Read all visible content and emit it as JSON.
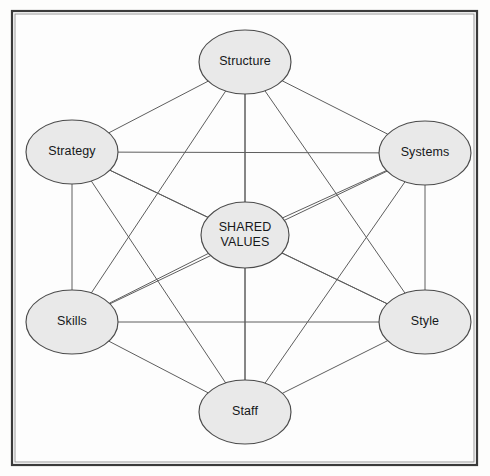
{
  "diagram": {
    "name": "McKinsey 7S Framework",
    "type": "network-diagram",
    "graph": "complete-graph-k7",
    "frame": {
      "x": 12,
      "y": 11,
      "width": 465,
      "height": 454,
      "border_color": "#3a3a3a",
      "background_color": "#fdfdfd"
    },
    "style": {
      "node_fill": "#e9e9e9",
      "node_stroke": "#4b4b4b",
      "edge_color": "#5e5e5e",
      "label_color": "#16181a",
      "page_background": "#fdfdfc"
    },
    "node_geometry": {
      "rx": 46,
      "ry": 32
    },
    "nodes": [
      {
        "id": "structure",
        "label": "Structure",
        "lines": [
          "Structure"
        ],
        "cx": 245,
        "cy": 62,
        "rx": 46,
        "ry": 32
      },
      {
        "id": "systems",
        "label": "Systems",
        "lines": [
          "Systems"
        ],
        "cx": 425,
        "cy": 153,
        "rx": 46,
        "ry": 32
      },
      {
        "id": "style",
        "label": "Style",
        "lines": [
          "Style"
        ],
        "cx": 425,
        "cy": 322,
        "rx": 46,
        "ry": 32
      },
      {
        "id": "staff",
        "label": "Staff",
        "lines": [
          "Staff"
        ],
        "cx": 245,
        "cy": 412,
        "rx": 46,
        "ry": 32
      },
      {
        "id": "skills",
        "label": "Skills",
        "lines": [
          "Skills"
        ],
        "cx": 72,
        "cy": 322,
        "rx": 46,
        "ry": 32
      },
      {
        "id": "strategy",
        "label": "Strategy",
        "lines": [
          "Strategy"
        ],
        "cx": 72,
        "cy": 152,
        "rx": 46,
        "ry": 32
      },
      {
        "id": "shared_values",
        "label": "SHARED VALUES",
        "lines": [
          "SHARED",
          "VALUES"
        ],
        "cx": 245,
        "cy": 235,
        "rx": 44,
        "ry": 33
      }
    ],
    "edges": [
      {
        "from": "structure",
        "to": "systems"
      },
      {
        "from": "structure",
        "to": "style"
      },
      {
        "from": "structure",
        "to": "staff"
      },
      {
        "from": "structure",
        "to": "skills"
      },
      {
        "from": "structure",
        "to": "strategy"
      },
      {
        "from": "structure",
        "to": "shared_values"
      },
      {
        "from": "systems",
        "to": "style"
      },
      {
        "from": "systems",
        "to": "staff"
      },
      {
        "from": "systems",
        "to": "skills"
      },
      {
        "from": "systems",
        "to": "strategy"
      },
      {
        "from": "systems",
        "to": "shared_values"
      },
      {
        "from": "style",
        "to": "staff"
      },
      {
        "from": "style",
        "to": "skills"
      },
      {
        "from": "style",
        "to": "strategy"
      },
      {
        "from": "style",
        "to": "shared_values"
      },
      {
        "from": "staff",
        "to": "skills"
      },
      {
        "from": "staff",
        "to": "strategy"
      },
      {
        "from": "staff",
        "to": "shared_values"
      },
      {
        "from": "skills",
        "to": "strategy"
      },
      {
        "from": "skills",
        "to": "shared_values"
      },
      {
        "from": "strategy",
        "to": "shared_values"
      }
    ]
  }
}
